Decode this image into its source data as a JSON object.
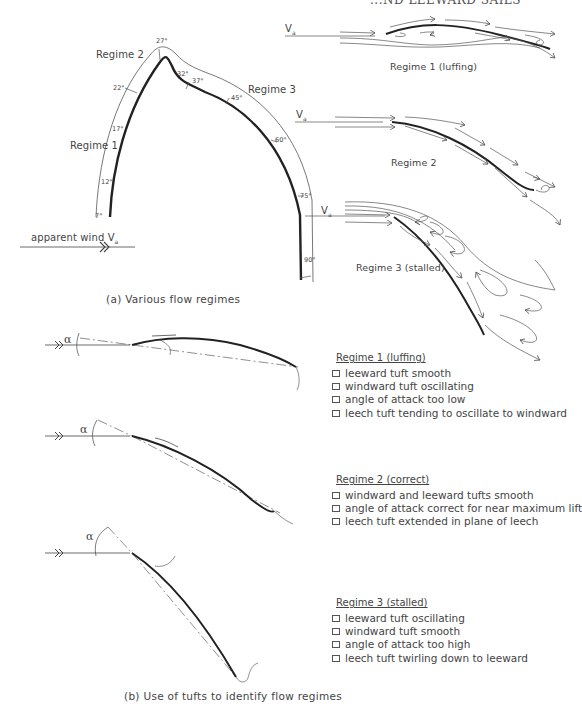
{
  "header": {
    "running_title_cropped": "...ND LEEWARD SAILS"
  },
  "panel_a": {
    "caption": "(a)  Various  flow  regimes",
    "wind_label": "apparent wind  V",
    "wind_subscript": "a",
    "regime_labels": [
      "Regime 1",
      "Regime  2",
      "Regime 3"
    ],
    "angle_marks": [
      "7°",
      "12°",
      "17°",
      "22°",
      "27°",
      "32°",
      "37°",
      "45°",
      "60°",
      "75°",
      "90°"
    ],
    "flow_diagrams": [
      {
        "label": "Regime  1  (luffing)",
        "wind": "V",
        "wind_sub": "a"
      },
      {
        "label": "Regime  2",
        "wind": "V",
        "wind_sub": "a"
      },
      {
        "label": "Regime  3  (stalled)",
        "wind": "V",
        "wind_sub": "a"
      }
    ]
  },
  "panel_b": {
    "caption": "(b)  Use  of  tufts  to  identify  flow  regimes",
    "alpha_symbol": "α",
    "regimes": [
      {
        "heading": "Regime  1  (luffing)",
        "items": [
          "leeward  tuft  smooth",
          "windward  tuft  oscillating",
          "angle  of  attack  too  low",
          "leech  tuft  tending  to  oscillate  to  windward"
        ]
      },
      {
        "heading": "Regime  2  (correct)",
        "items": [
          "windward  and  leeward  tufts  smooth",
          "angle  of  attack  correct  for  near  maximum  lift",
          "leech  tuft  extended  in  plane  of  leech"
        ]
      },
      {
        "heading": "Regime  3  (stalled)",
        "items": [
          "leeward  tuft  oscillating",
          "windward  tuft  smooth",
          "angle  of  attack  too  high",
          "leech  tuft  twirling  down  to  leeward"
        ]
      }
    ]
  },
  "colors": {
    "ink": "#333333",
    "thin_line": "#555555",
    "background": "#ffffff"
  }
}
